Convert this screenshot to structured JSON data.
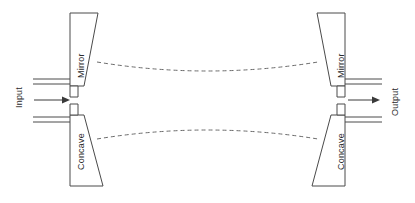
{
  "diagram": {
    "type": "schematic",
    "canvas": {
      "width": 415,
      "height": 203,
      "background": "#ffffff"
    },
    "colors": {
      "outline": "#4a4a4a",
      "dashed_beam": "#6b6b6b",
      "arrow": "#3a3a3a",
      "text": "#2b2b2b",
      "background": "#ffffff"
    },
    "labels": {
      "input": "Input",
      "output": "Output",
      "mirror_left": "Mirror",
      "mirror_right": "Mirror",
      "concave_left": "Concave",
      "concave_right": "Concave"
    },
    "components": [
      {
        "name": "left-top-mirror-block",
        "label": "Mirror",
        "orientation": "vertical-text-rotated-90",
        "side": "left",
        "position": "top"
      },
      {
        "name": "left-bottom-concave-block",
        "label": "Concave",
        "orientation": "vertical-text-rotated-90",
        "side": "left",
        "position": "bottom"
      },
      {
        "name": "right-top-mirror-block",
        "label": "Mirror",
        "orientation": "vertical-text-rotated-90",
        "side": "right",
        "position": "top"
      },
      {
        "name": "right-bottom-concave-block",
        "label": "Concave",
        "orientation": "vertical-text-rotated-90",
        "side": "right",
        "position": "bottom"
      }
    ],
    "beam": {
      "description": "dashed beam envelope, waist at center",
      "upper_curve": "M 97 62 Q 207 80 318 62",
      "lower_curve": "M 97 139 Q 207 121 318 139",
      "style": "dashed"
    },
    "arrows": [
      {
        "name": "input-arrow",
        "direction": "right",
        "side": "left"
      },
      {
        "name": "output-arrow",
        "direction": "right",
        "side": "right"
      }
    ]
  }
}
